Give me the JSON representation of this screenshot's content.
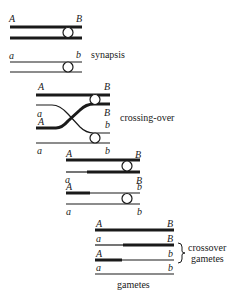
{
  "diagram": {
    "stages": [
      {
        "name": "synapsis",
        "caption": "synapsis",
        "chromosomes": [
          {
            "left": "A",
            "right": "B"
          },
          {
            "left": "a",
            "right": "b"
          }
        ]
      },
      {
        "name": "crossing-over",
        "caption": "crossing-over",
        "chromatids": [
          {
            "left": "A",
            "right": "B"
          },
          {
            "left": "a",
            "right": "B"
          },
          {
            "left": "A",
            "right": "b"
          },
          {
            "left": "a",
            "right": "b"
          }
        ]
      },
      {
        "name": "after-crossing-over",
        "chromatids": [
          {
            "left": "A",
            "right": "B"
          },
          {
            "left": "a",
            "right": "B"
          },
          {
            "left": "A",
            "right": "b"
          },
          {
            "left": "a",
            "right": "b"
          }
        ]
      },
      {
        "name": "gametes",
        "caption": "gametes",
        "bracket_caption_line1": "crossover",
        "bracket_caption_line2": "gametes",
        "chromatids": [
          {
            "left": "A",
            "right": "B"
          },
          {
            "left": "a",
            "right": "B"
          },
          {
            "left": "A",
            "right": "b"
          },
          {
            "left": "a",
            "right": "b"
          }
        ]
      }
    ],
    "colors": {
      "line": "#1a1a1a",
      "background": "#ffffff"
    }
  }
}
